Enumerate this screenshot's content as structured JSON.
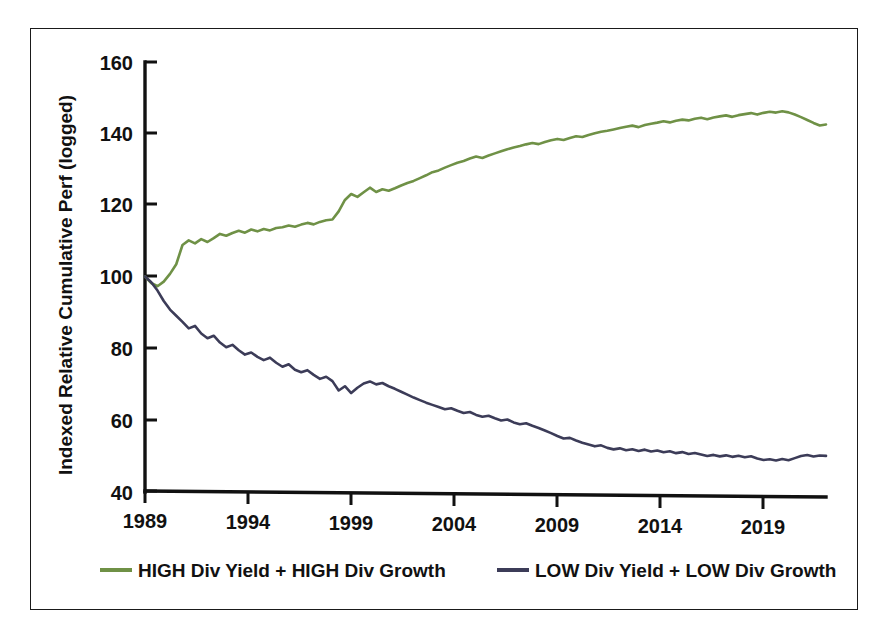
{
  "chart_data": {
    "type": "line",
    "title": "",
    "xlabel": "",
    "ylabel": "Indexed Relative Cumulative Perf (logged)",
    "xlim": [
      1989,
      2022
    ],
    "ylim": [
      40,
      160
    ],
    "grid": false,
    "legend_position": "bottom",
    "yticks": [
      40,
      60,
      80,
      100,
      120,
      140,
      160
    ],
    "ytick_labels": [
      "40",
      "60",
      "80",
      "100",
      "120",
      "140",
      "160"
    ],
    "xticks": [
      1989,
      1994,
      1999,
      2004,
      2009,
      2014,
      2019
    ],
    "xtick_labels": [
      "1989",
      "1994",
      "1999",
      "2004",
      "2009",
      "2014",
      "2019"
    ],
    "x": [
      1989.0,
      1989.3,
      1989.6,
      1989.9,
      1990.2,
      1990.5,
      1990.8,
      1991.1,
      1991.4,
      1991.7,
      1992.0,
      1992.3,
      1992.6,
      1992.9,
      1993.2,
      1993.5,
      1993.8,
      1994.1,
      1994.4,
      1994.7,
      1995.0,
      1995.3,
      1995.6,
      1995.9,
      1996.2,
      1996.5,
      1996.8,
      1997.1,
      1997.4,
      1997.7,
      1998.0,
      1998.3,
      1998.6,
      1998.9,
      1999.2,
      1999.5,
      1999.8,
      2000.1,
      2000.4,
      2000.7,
      2001.0,
      2001.3,
      2001.6,
      2001.9,
      2002.2,
      2002.5,
      2002.8,
      2003.1,
      2003.4,
      2003.7,
      2004.0,
      2004.3,
      2004.6,
      2004.9,
      2005.2,
      2005.5,
      2005.8,
      2006.1,
      2006.4,
      2006.7,
      2007.0,
      2007.3,
      2007.6,
      2007.9,
      2008.2,
      2008.5,
      2008.8,
      2009.1,
      2009.4,
      2009.7,
      2010.0,
      2010.3,
      2010.6,
      2010.9,
      2011.2,
      2011.5,
      2011.8,
      2012.1,
      2012.4,
      2012.7,
      2013.0,
      2013.3,
      2013.6,
      2013.9,
      2014.2,
      2014.5,
      2014.8,
      2015.1,
      2015.4,
      2015.7,
      2016.0,
      2016.3,
      2016.6,
      2016.9,
      2017.2,
      2017.5,
      2017.8,
      2018.1,
      2018.4,
      2018.7,
      2019.0,
      2019.3,
      2019.6,
      2019.9,
      2020.2,
      2020.5,
      2020.8,
      2021.1,
      2021.4,
      2021.7
    ],
    "series": [
      {
        "name": "HIGH Div Yield + HIGH Div Growth",
        "color": "#6f9146",
        "values": [
          100.0,
          98.2,
          97.3,
          98.6,
          100.8,
          103.5,
          108.9,
          110.2,
          109.4,
          110.6,
          109.8,
          110.9,
          112.1,
          111.6,
          112.4,
          113.0,
          112.5,
          113.4,
          112.9,
          113.6,
          113.2,
          113.9,
          114.1,
          114.6,
          114.3,
          114.9,
          115.4,
          115.0,
          115.7,
          116.2,
          116.4,
          118.7,
          121.9,
          123.6,
          122.8,
          124.1,
          125.4,
          124.2,
          125.0,
          124.6,
          125.3,
          126.1,
          126.8,
          127.4,
          128.2,
          129.0,
          129.9,
          130.4,
          131.2,
          131.9,
          132.6,
          133.1,
          133.8,
          134.4,
          134.0,
          134.7,
          135.3,
          135.9,
          136.5,
          137.0,
          137.4,
          137.9,
          138.3,
          138.0,
          138.6,
          139.1,
          139.5,
          139.2,
          139.8,
          140.3,
          140.1,
          140.7,
          141.2,
          141.6,
          141.9,
          142.3,
          142.7,
          143.1,
          143.4,
          143.0,
          143.6,
          144.0,
          144.3,
          144.7,
          144.4,
          144.9,
          145.2,
          145.0,
          145.5,
          145.8,
          145.4,
          145.9,
          146.2,
          146.5,
          146.1,
          146.6,
          146.9,
          147.2,
          146.8,
          147.3,
          147.6,
          147.4,
          147.8,
          147.5,
          146.9,
          146.2,
          145.4,
          144.6,
          143.9,
          144.2
        ]
      },
      {
        "name": "LOW Div Yield + LOW Div Growth",
        "color": "#3c3c58",
        "values": [
          100.0,
          98.4,
          96.1,
          93.2,
          90.8,
          89.1,
          87.4,
          85.6,
          86.3,
          84.2,
          82.9,
          83.6,
          81.7,
          80.4,
          81.1,
          79.6,
          78.4,
          79.0,
          77.8,
          76.9,
          77.6,
          76.2,
          75.1,
          75.8,
          74.3,
          73.6,
          74.2,
          72.9,
          71.8,
          72.4,
          71.2,
          68.6,
          69.8,
          67.9,
          69.4,
          70.6,
          71.2,
          70.4,
          70.8,
          69.9,
          69.2,
          68.4,
          67.6,
          66.8,
          66.1,
          65.4,
          64.8,
          64.2,
          63.6,
          63.9,
          63.2,
          62.6,
          62.9,
          62.1,
          61.6,
          61.9,
          61.2,
          60.6,
          60.9,
          60.1,
          59.6,
          59.9,
          59.2,
          58.6,
          57.9,
          57.2,
          56.4,
          55.7,
          55.9,
          55.2,
          54.6,
          54.1,
          53.6,
          53.9,
          53.2,
          52.8,
          53.1,
          52.6,
          52.9,
          52.4,
          52.8,
          52.3,
          52.6,
          52.1,
          52.4,
          51.9,
          52.2,
          51.7,
          52.0,
          51.6,
          51.2,
          51.5,
          51.1,
          51.4,
          51.0,
          51.3,
          50.9,
          51.2,
          50.6,
          50.2,
          50.4,
          50.1,
          50.5,
          50.2,
          50.8,
          51.4,
          51.7,
          51.3,
          51.6,
          51.5
        ]
      }
    ]
  },
  "legend": {
    "items": [
      {
        "label": "HIGH Div Yield + HIGH Div Growth",
        "color": "#6f9146"
      },
      {
        "label": "LOW Div Yield + LOW Div Growth",
        "color": "#3c3c58"
      }
    ]
  },
  "colors": {
    "high_series": "#6f9146",
    "low_series": "#3c3c58",
    "axis": "#111111",
    "border": "#1a1a1a",
    "background": "#ffffff"
  }
}
